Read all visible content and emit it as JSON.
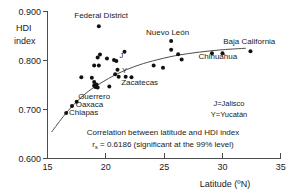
{
  "chart_data": {
    "type": "scatter",
    "title": "",
    "xlabel": "Latitude (ºN)",
    "ylabel": "HDI index",
    "ylabel_line1": "HDI",
    "ylabel_line2": "index",
    "xlim": [
      15,
      35
    ],
    "ylim": [
      0.6,
      0.9
    ],
    "grid": false,
    "xticks": [
      "15",
      "20",
      "25",
      "30",
      "35"
    ],
    "xtick_values": [
      15,
      20,
      25,
      30,
      35
    ],
    "yticks": [
      "0.600",
      "0.700",
      "0.800",
      "0.900"
    ],
    "ytick_values": [
      0.6,
      0.7,
      0.8,
      0.9
    ],
    "legend_position": "inside-right",
    "legend_entries": [
      "J=Jalisco",
      "Y=Yucatán"
    ],
    "annotations": [
      "Correlation between latitude and HDI index",
      "rs = 0.6186 (significant at the 99% level)"
    ],
    "annotation_r_prefix": "r",
    "annotation_r_subscript": "s",
    "annotation_r_rest": " = 0.6186 (significant at the 99% level)",
    "correlation_coefficient": 0.6186,
    "significance_level": "99%",
    "points": [
      {
        "x": 16.6,
        "y": 0.693,
        "label": "Chiapas"
      },
      {
        "x": 17.1,
        "y": 0.707,
        "label": "Oaxaca"
      },
      {
        "x": 17.5,
        "y": 0.716,
        "label": "Guerrero"
      },
      {
        "x": 17.9,
        "y": 0.766,
        "label": ""
      },
      {
        "x": 18.8,
        "y": 0.765,
        "label": ""
      },
      {
        "x": 19.0,
        "y": 0.756,
        "label": ""
      },
      {
        "x": 19.0,
        "y": 0.749,
        "label": ""
      },
      {
        "x": 19.1,
        "y": 0.746,
        "label": ""
      },
      {
        "x": 19.2,
        "y": 0.751,
        "label": ""
      },
      {
        "x": 19.3,
        "y": 0.745,
        "label": ""
      },
      {
        "x": 19.0,
        "y": 0.79,
        "label": ""
      },
      {
        "x": 19.4,
        "y": 0.79,
        "label": ""
      },
      {
        "x": 19.3,
        "y": 0.806,
        "label": ""
      },
      {
        "x": 19.5,
        "y": 0.812,
        "label": ""
      },
      {
        "x": 19.4,
        "y": 0.87,
        "label": "Federal District"
      },
      {
        "x": 20.1,
        "y": 0.804,
        "label": ""
      },
      {
        "x": 20.3,
        "y": 0.747,
        "label": ""
      },
      {
        "x": 20.7,
        "y": 0.801,
        "label": "J"
      },
      {
        "x": 20.9,
        "y": 0.799,
        "label": ""
      },
      {
        "x": 20.8,
        "y": 0.772,
        "label": ""
      },
      {
        "x": 21.0,
        "y": 0.781,
        "label": "Y"
      },
      {
        "x": 21.1,
        "y": 0.767,
        "label": ""
      },
      {
        "x": 21.6,
        "y": 0.818,
        "label": ""
      },
      {
        "x": 21.7,
        "y": 0.767,
        "label": ""
      },
      {
        "x": 22.2,
        "y": 0.766,
        "label": "Zacatecas"
      },
      {
        "x": 24.1,
        "y": 0.79,
        "label": ""
      },
      {
        "x": 24.9,
        "y": 0.785,
        "label": ""
      },
      {
        "x": 25.6,
        "y": 0.84,
        "label": "Nuevo León"
      },
      {
        "x": 25.6,
        "y": 0.822,
        "label": ""
      },
      {
        "x": 26.2,
        "y": 0.813,
        "label": ""
      },
      {
        "x": 26.5,
        "y": 0.802,
        "label": ""
      },
      {
        "x": 29.1,
        "y": 0.815,
        "label": "Chihuahua"
      },
      {
        "x": 30.0,
        "y": 0.815,
        "label": ""
      },
      {
        "x": 32.4,
        "y": 0.819,
        "label": "Baja California"
      }
    ],
    "point_labels": [
      {
        "text": "Federal District",
        "x": 19.6,
        "y": 0.886,
        "anchor": "middle"
      },
      {
        "text": "Nuevo León",
        "x": 25.3,
        "y": 0.852,
        "anchor": "middle"
      },
      {
        "text": "Baja California",
        "x": 32.3,
        "y": 0.834,
        "anchor": "middle"
      },
      {
        "text": "Chihuahua",
        "x": 29.6,
        "y": 0.804,
        "anchor": "middle"
      },
      {
        "text": "Zacatecas",
        "x": 22.9,
        "y": 0.75,
        "anchor": "middle"
      },
      {
        "text": "Guerrero",
        "x": 19.0,
        "y": 0.721,
        "anchor": "middle"
      },
      {
        "text": "Oaxaca",
        "x": 18.6,
        "y": 0.705,
        "anchor": "middle"
      },
      {
        "text": "Chiapas",
        "x": 18.1,
        "y": 0.688,
        "anchor": "middle"
      }
    ],
    "trend_line": {
      "description": "logarithmic best-fit curve",
      "points": [
        {
          "x": 15.35,
          "y": 0.654
        },
        {
          "x": 16.5,
          "y": 0.69
        },
        {
          "x": 17.5,
          "y": 0.716
        },
        {
          "x": 18.5,
          "y": 0.737
        },
        {
          "x": 19.5,
          "y": 0.753
        },
        {
          "x": 21.0,
          "y": 0.773
        },
        {
          "x": 22.5,
          "y": 0.788
        },
        {
          "x": 24.0,
          "y": 0.799
        },
        {
          "x": 26.0,
          "y": 0.81
        },
        {
          "x": 28.0,
          "y": 0.817
        },
        {
          "x": 30.0,
          "y": 0.822
        },
        {
          "x": 32.0,
          "y": 0.825
        }
      ]
    }
  },
  "colors": {
    "point": "#111111",
    "axis": "#4d4d4d",
    "curve": "#4d4d4d",
    "text": "#1a1a1a",
    "background": "#ffffff"
  }
}
